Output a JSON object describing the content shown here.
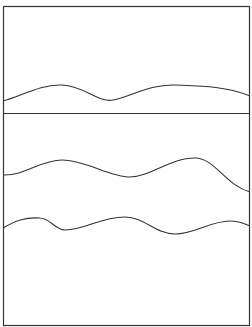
{
  "diagram": {
    "stroke_color": "#333333",
    "background": "#ffffff",
    "panels": [
      {
        "name": "top-panel",
        "curves": [
          {
            "name": "wave-1",
            "path": "M3,101 C20,97 40,84 62,85 C85,86 98,103 113,100 C130,97 150,84 175,85 C200,86 225,86 250,96"
          }
        ]
      },
      {
        "name": "bottom-panel",
        "curves": [
          {
            "name": "wave-2",
            "path": "M3,175 C25,176 40,160 62,160 C85,160 110,177 130,177 C150,177 170,158 195,158 C215,158 225,185 250,192"
          },
          {
            "name": "wave-3",
            "path": "M3,228 C15,221 25,217 40,218 C50,218 55,230 65,230 C85,230 100,217 125,217 C145,217 155,234 175,234 C195,234 210,221 230,221 C240,221 245,224 250,226"
          }
        ]
      }
    ]
  }
}
